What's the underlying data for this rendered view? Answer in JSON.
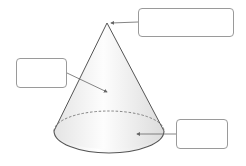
{
  "diagram": {
    "shape": "cone",
    "colors": {
      "outline": "#555555",
      "fill_light": "#fbfbfb",
      "fill_shade": "#e2e2e2",
      "arrow": "#666666",
      "box_border": "#9a9a9a"
    },
    "labels": [
      {
        "id": "apex",
        "text": "",
        "points_to": "apex of cone"
      },
      {
        "id": "curved-surface",
        "text": "",
        "points_to": "curved lateral surface"
      },
      {
        "id": "base",
        "text": "",
        "points_to": "circular base"
      }
    ]
  }
}
